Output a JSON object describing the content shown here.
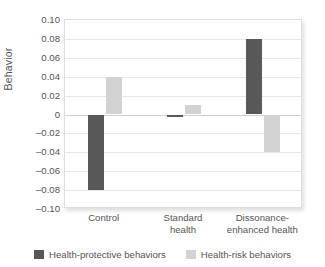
{
  "chart_data": {
    "type": "bar",
    "title": "",
    "xlabel": "",
    "ylabel": "Behavior",
    "ylim": [
      -0.1,
      0.1
    ],
    "ytick_labels": [
      "0.10",
      "0.08",
      "0.06",
      "0.04",
      "0.02",
      "0",
      "–0.02",
      "–0.04",
      "–0.06",
      "–0.08",
      "–0.10"
    ],
    "ytick_values": [
      0.1,
      0.08,
      0.06,
      0.04,
      0.02,
      0,
      -0.02,
      -0.04,
      -0.06,
      -0.08,
      -0.1
    ],
    "grid": true,
    "legend_position": "bottom",
    "categories": [
      "Control",
      "Standard health",
      "Dissonance-enhanced health"
    ],
    "category_label_lines": [
      [
        "Control"
      ],
      [
        "Standard",
        "health"
      ],
      [
        "Dissonance-",
        "enhanced health"
      ]
    ],
    "series": [
      {
        "name": "Health-protective behaviors",
        "color": "#585858",
        "values": [
          -0.08,
          -0.003,
          0.08
        ]
      },
      {
        "name": "Health-risk behaviors",
        "color": "#d2d2d2",
        "values": [
          0.04,
          0.01,
          -0.04
        ]
      }
    ]
  },
  "colors": {
    "protective": "#585858",
    "risk": "#d2d2d2",
    "gridline": "#e6e6e6",
    "zeroline": "#cfcfcf",
    "frame": "#dedede",
    "text": "#555555"
  }
}
